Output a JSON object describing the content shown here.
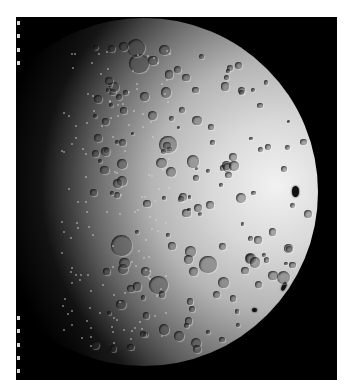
{
  "image": {
    "subject": "Moon (far side), partially illuminated",
    "description": "Black-and-white lunar photograph showing a heavily cratered hemisphere lit from the right, with a dark terminator on the left and a bright limb on the right; film-edge tick marks along the left border.",
    "colors": {
      "background": "#ffffff",
      "frame": "#000000",
      "lit_limb": "#f2f2f2",
      "ticks": "#d8d8d8"
    },
    "tick_count": 27
  }
}
